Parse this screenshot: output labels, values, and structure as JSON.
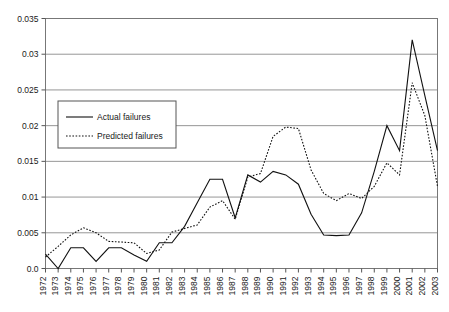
{
  "chart_data": {
    "type": "line",
    "title": "",
    "subtitle": "",
    "xlabel": "",
    "ylabel": "",
    "grid": true,
    "legend_position": "upper-left-inside",
    "xlim": [
      1972,
      2003
    ],
    "ylim": [
      0.0,
      0.035
    ],
    "ytick_labels": [
      "0.0",
      "0.005",
      "0.01",
      "0.015",
      "0.02",
      "0.025",
      "0.03",
      "0.035"
    ],
    "ytick_values": [
      0.0,
      0.005,
      0.01,
      0.015,
      0.02,
      0.025,
      0.03,
      0.035
    ],
    "categories": [
      "1972",
      "1973",
      "1974",
      "1975",
      "1976",
      "1977",
      "1978",
      "1979",
      "1980",
      "1981",
      "1982",
      "1983",
      "1984",
      "1985",
      "1986",
      "1987",
      "1988",
      "1989",
      "1990",
      "1991",
      "1992",
      "1993",
      "1994",
      "1995",
      "1996",
      "1997",
      "1998",
      "1999",
      "2000",
      "2001",
      "2002",
      "2003"
    ],
    "x": [
      1972,
      1973,
      1974,
      1975,
      1976,
      1977,
      1978,
      1979,
      1980,
      1981,
      1982,
      1983,
      1984,
      1985,
      1986,
      1987,
      1988,
      1989,
      1990,
      1991,
      1992,
      1993,
      1994,
      1995,
      1996,
      1997,
      1998,
      1999,
      2000,
      2001,
      2002,
      2003
    ],
    "series": [
      {
        "name": "Actual failures",
        "style": "solid",
        "color": "#111111",
        "values": [
          0.002,
          0.0,
          0.0029,
          0.0029,
          0.001,
          0.0029,
          0.0029,
          0.0019,
          0.001,
          0.0036,
          0.0036,
          0.0059,
          0.0092,
          0.0125,
          0.0125,
          0.0071,
          0.0131,
          0.0121,
          0.0136,
          0.0131,
          0.0118,
          0.0076,
          0.0047,
          0.0046,
          0.0047,
          0.0078,
          0.0136,
          0.02,
          0.0165,
          0.032,
          0.0242,
          0.0165
        ]
      },
      {
        "name": "Predicted failures",
        "style": "dotted",
        "color": "#111111",
        "values": [
          0.0016,
          0.0031,
          0.0047,
          0.0057,
          0.005,
          0.0038,
          0.0037,
          0.0036,
          0.0021,
          0.0026,
          0.0051,
          0.0056,
          0.0061,
          0.0086,
          0.0095,
          0.0069,
          0.0128,
          0.0133,
          0.0185,
          0.0198,
          0.0196,
          0.0138,
          0.0105,
          0.0095,
          0.0105,
          0.0098,
          0.0115,
          0.0148,
          0.0131,
          0.026,
          0.0214,
          0.0115
        ]
      }
    ],
    "legend": [
      {
        "label": "Actual failures",
        "style": "solid"
      },
      {
        "label": "Predicted failures",
        "style": "dotted"
      }
    ]
  }
}
